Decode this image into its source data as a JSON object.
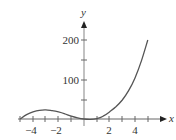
{
  "chart_data": {
    "type": "line",
    "title": "",
    "xlabel": "x",
    "ylabel": "y",
    "xlim": [
      -5,
      5
    ],
    "ylim": [
      0,
      200
    ],
    "grid": false,
    "legend": null,
    "x_ticks": [
      -5,
      -4,
      -3,
      -2,
      -1,
      1,
      2,
      3,
      4,
      5
    ],
    "x_tick_labels": [
      "-4",
      "-2",
      "2",
      "4"
    ],
    "y_ticks": [
      50,
      100,
      150,
      200
    ],
    "y_tick_labels": [
      "100",
      "200"
    ],
    "series": [
      {
        "name": "f(x)",
        "x": [
          -5,
          -4.5,
          -4,
          -3.5,
          -3,
          -2.5,
          -2,
          -1.5,
          -1,
          -0.5,
          0,
          0.5,
          1,
          1.5,
          2,
          2.5,
          3,
          3.5,
          4,
          4.5,
          5
        ],
        "y": [
          0,
          11,
          18,
          22,
          23,
          21,
          18,
          13,
          7,
          3,
          0,
          -1,
          1,
          7,
          18,
          31,
          48,
          72,
          104,
          147,
          200
        ]
      }
    ]
  },
  "labels": {
    "x_axis": "x",
    "y_axis": "y",
    "xt_m4": "−4",
    "xt_m2": "−2",
    "xt_2": "2",
    "xt_4": "4",
    "yt_100": "100",
    "yt_200": "200"
  }
}
